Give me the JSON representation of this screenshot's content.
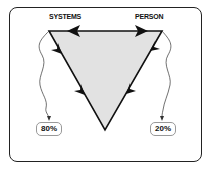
{
  "diagram": {
    "type": "flow-triangle",
    "nodes": {
      "left": {
        "label": "SYSTEMS",
        "share": "80%"
      },
      "right": {
        "label": "PERSON",
        "share": "20%"
      }
    },
    "edges": [
      {
        "from": "PERSON",
        "to": "SYSTEMS",
        "side": "top",
        "direction": "left"
      },
      {
        "from": "SYSTEMS",
        "to": "PERSON",
        "side": "top",
        "direction": "right"
      },
      {
        "from": "SYSTEMS",
        "to": "bottom-vertex",
        "side": "left",
        "direction": "down"
      },
      {
        "from": "PERSON",
        "to": "bottom-vertex",
        "side": "right",
        "direction": "down"
      }
    ],
    "colors": {
      "triangle_fill": "#e2e2e2",
      "stroke": "#111111",
      "frame": "#222222"
    }
  }
}
